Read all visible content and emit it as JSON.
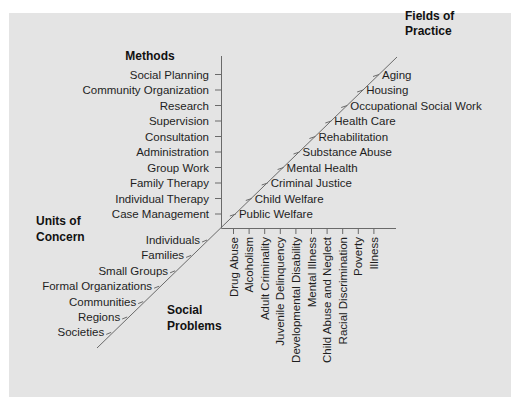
{
  "diagram": {
    "type": "four-dimension axis diagram",
    "colors": {
      "panel": "#e4e4e4",
      "axis": "#6a6a6a",
      "text": "#1e1e1e"
    },
    "methods": {
      "title": "Methods",
      "items": [
        "Social Planning",
        "Community Organization",
        "Research",
        "Supervision",
        "Consultation",
        "Administration",
        "Group Work",
        "Family Therapy",
        "Individual Therapy",
        "Case Management"
      ]
    },
    "fields_of_practice": {
      "title_line1": "Fields of",
      "title_line2": "Practice",
      "items": [
        "Aging",
        "Housing",
        "Occupational Social Work",
        "Health Care",
        "Rehabilitation",
        "Substance Abuse",
        "Mental Health",
        "Criminal Justice",
        "Child Welfare",
        "Public Welfare"
      ]
    },
    "units_of_concern": {
      "title_line1": "Units of",
      "title_line2": "Concern",
      "items": [
        "Individuals",
        "Families",
        "Small Groups",
        "Formal Organizations",
        "Communities",
        "Regions",
        "Societies"
      ]
    },
    "social_problems": {
      "title_line1": "Social",
      "title_line2": "Problems",
      "items": [
        "Drug Abuse",
        "Alcoholism",
        "Adult Criminality",
        "Juvenile Delinquency",
        "Developmental Disability",
        "Mental Illness",
        "Child Abuse and Neglect",
        "Racial Discrimination",
        "Poverty",
        "Illness"
      ]
    }
  }
}
